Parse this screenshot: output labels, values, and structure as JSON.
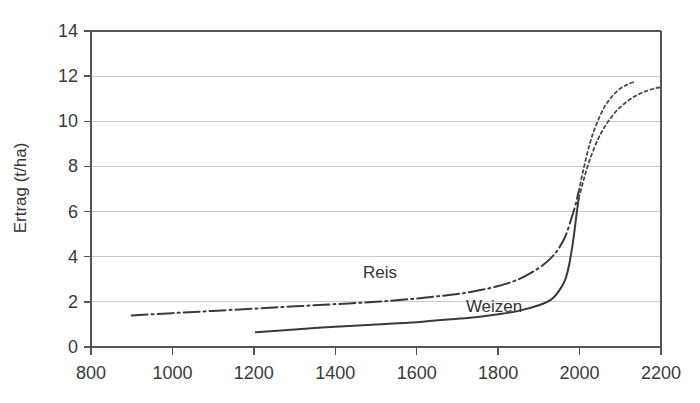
{
  "chart_data": {
    "type": "line",
    "title": "",
    "xlabel": "",
    "ylabel": "Ertrag (t/ha)",
    "xlim": [
      800,
      2200
    ],
    "ylim": [
      0,
      14
    ],
    "xticks": [
      800,
      1000,
      1200,
      1400,
      1600,
      1800,
      2000,
      2200
    ],
    "yticks": [
      0,
      2,
      4,
      6,
      8,
      10,
      12,
      14
    ],
    "grid": "horizontal",
    "legend": "inline-annotations",
    "series": [
      {
        "name": "Reis",
        "style": "dash-dot",
        "label_x": 1510,
        "label_y": 3.05,
        "x": [
          900,
          1000,
          1100,
          1200,
          1300,
          1400,
          1500,
          1600,
          1700,
          1750,
          1800,
          1850,
          1900,
          1930,
          1950,
          1965,
          1980,
          1990,
          1998
        ],
        "y": [
          1.4,
          1.5,
          1.6,
          1.7,
          1.8,
          1.9,
          2.0,
          2.15,
          2.35,
          2.5,
          2.7,
          3.0,
          3.5,
          3.95,
          4.4,
          4.9,
          5.7,
          6.3,
          6.9
        ]
      },
      {
        "name": "Weizen",
        "style": "solid",
        "label_x": 1790,
        "label_y": 1.55,
        "x": [
          1205,
          1300,
          1400,
          1500,
          1600,
          1700,
          1750,
          1800,
          1850,
          1900,
          1930,
          1950,
          1965,
          1975,
          1985,
          1992,
          1998
        ],
        "y": [
          0.65,
          0.78,
          0.9,
          1.0,
          1.1,
          1.25,
          1.33,
          1.45,
          1.6,
          1.85,
          2.1,
          2.5,
          3.0,
          3.7,
          4.8,
          5.8,
          6.6
        ]
      },
      {
        "name": "Reis-projektion",
        "style": "dotted",
        "x": [
          1998,
          2010,
          2025,
          2040,
          2060,
          2080,
          2100,
          2120,
          2135
        ],
        "y": [
          6.9,
          7.9,
          9.0,
          9.8,
          10.6,
          11.1,
          11.45,
          11.65,
          11.75
        ]
      },
      {
        "name": "Weizen-projektion",
        "style": "dotted",
        "x": [
          1998,
          2010,
          2025,
          2045,
          2065,
          2090,
          2115,
          2140,
          2165,
          2190,
          2200
        ],
        "y": [
          6.6,
          7.4,
          8.3,
          9.2,
          9.85,
          10.45,
          10.85,
          11.15,
          11.35,
          11.48,
          11.5
        ]
      }
    ]
  },
  "axes": {
    "y_axis_title": "Ertrag (t/ha)",
    "x_tick_labels": [
      "800",
      "1000",
      "1200",
      "1400",
      "1600",
      "1800",
      "2000",
      "2200"
    ],
    "y_tick_labels": [
      "0",
      "2",
      "4",
      "6",
      "8",
      "10",
      "12",
      "14"
    ]
  },
  "annotations": {
    "reis_label": "Reis",
    "weizen_label": "Weizen"
  },
  "colors": {
    "line": "#3a3a3a",
    "grid": "#c9c9c9",
    "frame": "#555555",
    "background": "#ffffff"
  }
}
